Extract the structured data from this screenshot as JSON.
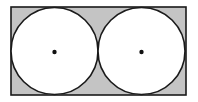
{
  "diagram": {
    "colors": {
      "background": "#ffffff",
      "shaded": "#c4c4c4",
      "circle_fill": "#ffffff",
      "stroke": "#1a1a1a",
      "center_dot": "#111111"
    },
    "rectangle": {
      "x": 11,
      "y": 7,
      "width": 175,
      "height": 88
    },
    "circles": [
      {
        "cx": 54.5,
        "cy": 51,
        "r": 43.5,
        "center_dot": {
          "cx": 54.5,
          "cy": 52,
          "r": 2.2
        }
      },
      {
        "cx": 141.5,
        "cy": 51,
        "r": 43.5,
        "center_dot": {
          "cx": 141.5,
          "cy": 52,
          "r": 2.2
        }
      }
    ]
  }
}
